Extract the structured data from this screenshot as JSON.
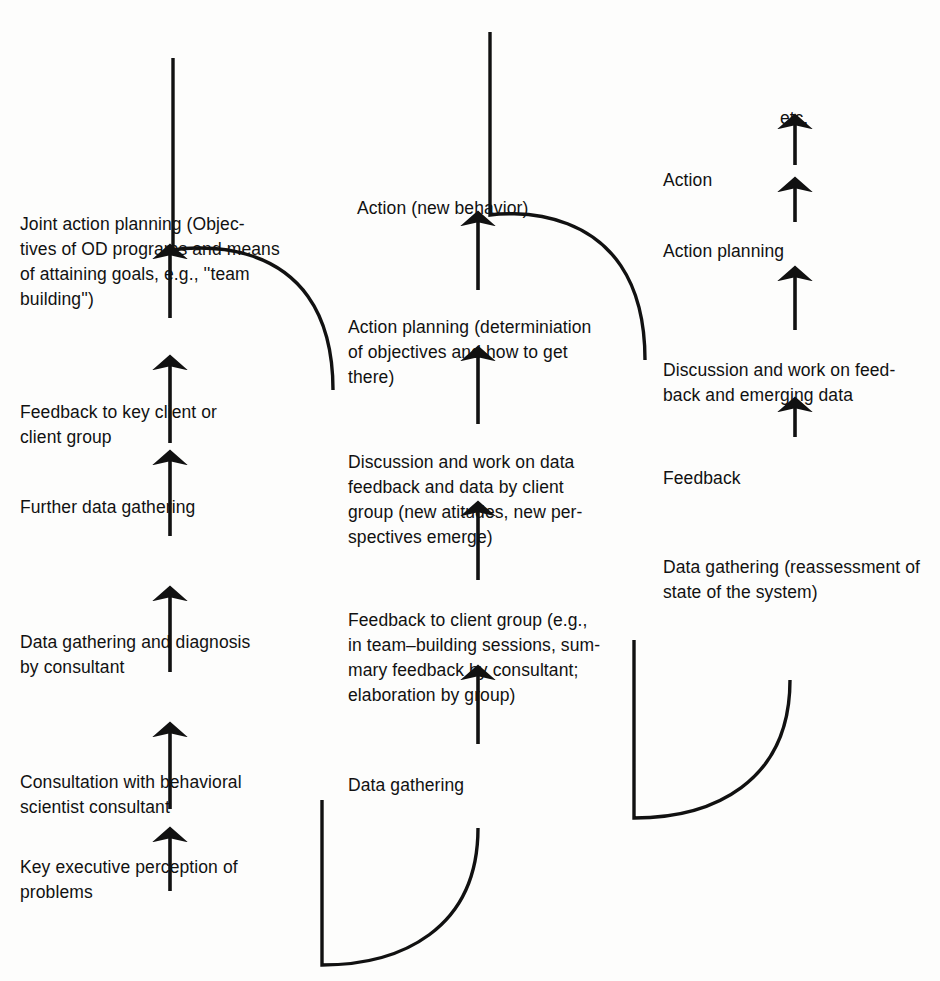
{
  "diagram": {
    "background_color": "#fdfdfc",
    "ink_color": "#111111",
    "columns": [
      {
        "id": "cycle-1",
        "steps": [
          {
            "id": "c1-s1",
            "text": "Key executive perception of\nproblems",
            "x": 20,
            "y": 855
          },
          {
            "id": "c1-s2",
            "text": "Consultation with behavioral\nscientist consultant",
            "x": 20,
            "y": 770
          },
          {
            "id": "c1-s3",
            "text": "Data gathering and diagnosis\nby consultant",
            "x": 20,
            "y": 630
          },
          {
            "id": "c1-s4",
            "text": "Further data gathering",
            "x": 20,
            "y": 495
          },
          {
            "id": "c1-s5",
            "text": "Feedback to key client or\nclient group",
            "x": 20,
            "y": 400
          },
          {
            "id": "c1-s6",
            "text": "Joint action planning (Objec-\ntives of OD programs and means\nof attaining goals, e.g., ''team\nbuilding'')",
            "x": 20,
            "y": 212
          }
        ]
      },
      {
        "id": "cycle-2",
        "steps": [
          {
            "id": "c2-s1",
            "text": "Data gathering",
            "x": 348,
            "y": 773
          },
          {
            "id": "c2-s2",
            "text": "Feedback to client group (e.g.,\nin team–building sessions, sum-\nmary feedback by consultant;\nelaboration by group)",
            "x": 348,
            "y": 608
          },
          {
            "id": "c2-s3",
            "text": "Discussion and work on data\nfeedback and data by client\ngroup (new atitudes, new per-\nspectives emerge)",
            "x": 348,
            "y": 450
          },
          {
            "id": "c2-s4",
            "text": "Action planning (determiniation\nof objectives and how to get\nthere)",
            "x": 348,
            "y": 315
          },
          {
            "id": "c2-s5",
            "text": "Action (new behavior)",
            "x": 357,
            "y": 196
          }
        ]
      },
      {
        "id": "cycle-3",
        "steps": [
          {
            "id": "c3-s1",
            "text": "Data gathering (reassessment of\nstate of the system)",
            "x": 663,
            "y": 555
          },
          {
            "id": "c3-s2",
            "text": "Feedback",
            "x": 663,
            "y": 466
          },
          {
            "id": "c3-s3",
            "text": "Discussion and work on feed-\nback and emerging data",
            "x": 663,
            "y": 358
          },
          {
            "id": "c3-s4",
            "text": "Action planning",
            "x": 663,
            "y": 239
          },
          {
            "id": "c3-s5",
            "text": "Action",
            "x": 663,
            "y": 168
          }
        ]
      }
    ],
    "terminator": {
      "id": "etc",
      "text": "etc.",
      "x": 780,
      "y": 106
    },
    "arrows": [
      {
        "id": "arrow-c1-1",
        "x": 170,
        "y_tail": 891,
        "y_head": 838
      },
      {
        "id": "arrow-c1-2",
        "x": 170,
        "y_tail": 809,
        "y_head": 733
      },
      {
        "id": "arrow-c1-3",
        "x": 170,
        "y_tail": 672,
        "y_head": 597
      },
      {
        "id": "arrow-c1-4",
        "x": 170,
        "y_tail": 536,
        "y_head": 461
      },
      {
        "id": "arrow-c1-5",
        "x": 170,
        "y_tail": 443,
        "y_head": 366
      },
      {
        "id": "arrow-c1-6",
        "x": 170,
        "y_tail": 318,
        "y_head": 255
      },
      {
        "id": "arrow-c2-1",
        "x": 478,
        "y_tail": 744,
        "y_head": 676
      },
      {
        "id": "arrow-c2-2",
        "x": 478,
        "y_tail": 580,
        "y_head": 512
      },
      {
        "id": "arrow-c2-3",
        "x": 478,
        "y_tail": 424,
        "y_head": 357
      },
      {
        "id": "arrow-c2-4",
        "x": 478,
        "y_tail": 290,
        "y_head": 222
      },
      {
        "id": "arrow-c3-1",
        "x": 795,
        "y_tail": 437,
        "y_head": 408
      },
      {
        "id": "arrow-c3-2",
        "x": 795,
        "y_tail": 330,
        "y_head": 277
      },
      {
        "id": "arrow-c3-3",
        "x": 795,
        "y_tail": 222,
        "y_head": 188
      },
      {
        "id": "arrow-c3-4",
        "x": 795,
        "y_tail": 165,
        "y_head": 125
      }
    ],
    "connectors": [
      {
        "id": "connector-top-left",
        "description": "descending loop from cycle 1 top down to cycle 2 column",
        "path": "M 173 58 L 173 250 C 173 250 333 220 333 390"
      },
      {
        "id": "connector-bottom-left",
        "description": "ascending loop from cycle 1 bottom up into cycle 2 start",
        "path": "M 322 800 L 322 965 C 400 965 478 930 478 828"
      },
      {
        "id": "connector-top-middle",
        "description": "descending loop from cycle 2 top down to cycle 3 column",
        "path": "M 490 32 L 490 215 C 490 215 645 190 645 360"
      },
      {
        "id": "connector-bottom-middle",
        "description": "ascending loop from cycle 2 bottom up into cycle 3 start",
        "path": "M 634 640 L 634 818 C 712 818 790 783 790 680"
      }
    ]
  }
}
